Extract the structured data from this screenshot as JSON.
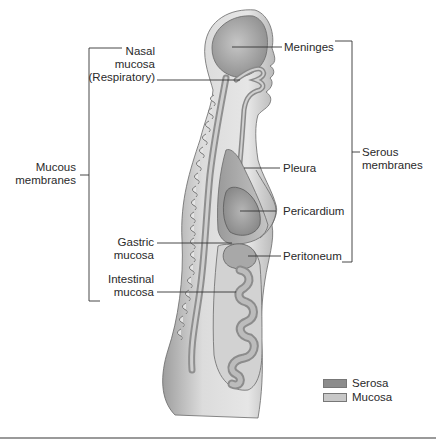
{
  "diagram": {
    "left_labels": {
      "nasal_mucosa": [
        "Nasal",
        "mucosa",
        "(Respiratory)"
      ],
      "mucous_membranes": [
        "Mucous",
        "membranes"
      ],
      "gastric_mucosa": [
        "Gastric",
        "mucosa"
      ],
      "intestinal_mucosa": [
        "Intestinal",
        "mucosa"
      ]
    },
    "right_labels": {
      "meninges": "Meninges",
      "pleura": "Pleura",
      "pericardium": "Pericardium",
      "peritoneum": "Peritoneum",
      "serous_membranes": [
        "Serous",
        "membranes"
      ]
    },
    "legend": {
      "items": [
        {
          "label": "Serosa",
          "color": "#8c8c8c"
        },
        {
          "label": "Mucosa",
          "color": "#c8c8c8"
        }
      ]
    },
    "colors": {
      "skin": "#d9d9d9",
      "skin_shade": "#a8a8a8",
      "serosa": "#9a9a9a",
      "mucosa": "#c4c4c4",
      "line": "#444444"
    }
  }
}
